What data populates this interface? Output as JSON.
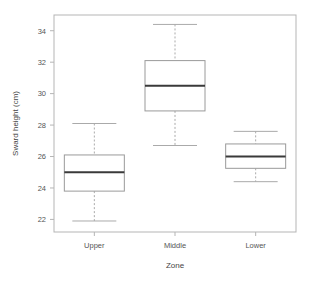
{
  "chart_data": {
    "type": "box",
    "title": "",
    "xlabel": "Zone",
    "ylabel": "Sward height (cm)",
    "categories": [
      "Upper",
      "Middle",
      "Lower"
    ],
    "ylim": [
      21.2,
      35.0
    ],
    "yticks": [
      22,
      24,
      26,
      28,
      30,
      32,
      34
    ],
    "ytick_labels": [
      "22",
      "24",
      "26",
      "28",
      "30",
      "32",
      "34"
    ],
    "grid": false,
    "legend": "none",
    "boxes": [
      {
        "category": "Upper",
        "whisker_low": 21.9,
        "q1": 23.8,
        "median": 25.0,
        "q3": 26.1,
        "whisker_high": 28.1,
        "outliers": []
      },
      {
        "category": "Middle",
        "whisker_low": 26.7,
        "q1": 28.9,
        "median": 30.5,
        "q3": 32.1,
        "whisker_high": 34.4,
        "outliers": []
      },
      {
        "category": "Lower",
        "whisker_low": 24.4,
        "q1": 25.25,
        "median": 26.0,
        "q3": 26.8,
        "whisker_high": 27.6,
        "outliers": []
      }
    ],
    "colors": {
      "box_stroke": "#9a9a9a",
      "median_stroke": "#3a3a3a",
      "whisker_stroke": "#aaaaaa",
      "frame_stroke": "#b5b5b5",
      "background": "#ffffff",
      "text": "#555555"
    }
  }
}
